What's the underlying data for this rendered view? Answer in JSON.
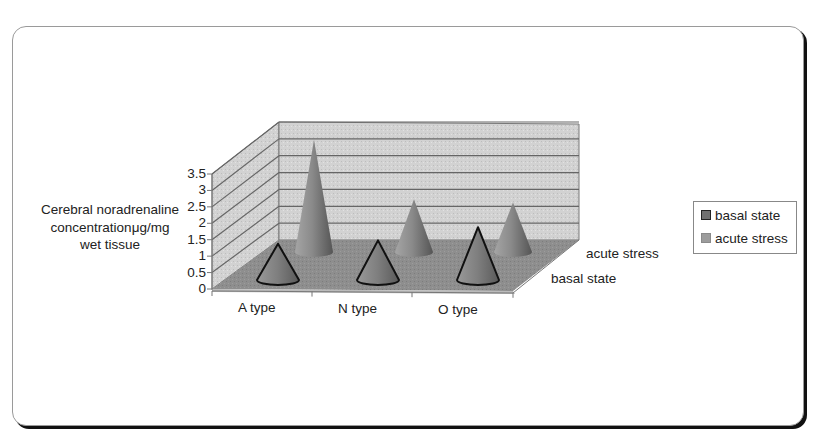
{
  "chart_data": {
    "type": "bar",
    "subtype": "3d-cone",
    "title": "",
    "xlabel": "",
    "ylabel": "Cerebral noradrenaline concentrationμg/mg wet tissue",
    "categories": [
      "A type",
      "N type",
      "O type"
    ],
    "series": [
      {
        "name": "basal state",
        "values": [
          1.1,
          1.2,
          1.6
        ],
        "color": "#6f6f6f"
      },
      {
        "name": "acute stress",
        "values": [
          3.4,
          1.6,
          1.5
        ],
        "color": "#8c8c8c"
      }
    ],
    "depth_labels": [
      "acute stress",
      "basal state"
    ],
    "yticks": [
      "0",
      "0.5",
      "1",
      "1.5",
      "2",
      "2.5",
      "3",
      "3.5"
    ],
    "ylim": [
      0,
      3.5
    ],
    "grid": true,
    "legend_position": "right"
  },
  "ylabel_lines": [
    "Cerebral noradrenaline",
    "concentrationμg/mg",
    "wet tissue"
  ],
  "legend": [
    {
      "label": "basal state"
    },
    {
      "label": "acute stress"
    }
  ]
}
